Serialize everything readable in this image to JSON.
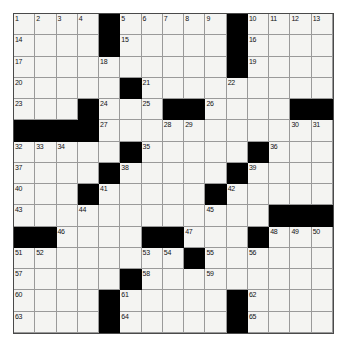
{
  "puzzle": {
    "title": "Crossword Puzzle Grid",
    "rows": 15,
    "cols": 15,
    "colors": {
      "block": "#000000",
      "cell": "#f4f4f2",
      "grid_line": "#8a8a8a",
      "border": "#4a4a4a",
      "number_text": "#121212",
      "background": "#ffffff"
    },
    "grid": [
      [
        {
          "type": "white",
          "number": "1"
        },
        {
          "type": "white",
          "number": "2"
        },
        {
          "type": "white",
          "number": "3"
        },
        {
          "type": "white",
          "number": "4"
        },
        {
          "type": "block",
          "number": ""
        },
        {
          "type": "white",
          "number": "5"
        },
        {
          "type": "white",
          "number": "6"
        },
        {
          "type": "white",
          "number": "7"
        },
        {
          "type": "white",
          "number": "8"
        },
        {
          "type": "white",
          "number": "9"
        },
        {
          "type": "block",
          "number": ""
        },
        {
          "type": "white",
          "number": "10"
        },
        {
          "type": "white",
          "number": "11"
        },
        {
          "type": "white",
          "number": "12"
        },
        {
          "type": "white",
          "number": "13"
        }
      ],
      [
        {
          "type": "white",
          "number": "14"
        },
        {
          "type": "white",
          "number": ""
        },
        {
          "type": "white",
          "number": ""
        },
        {
          "type": "white",
          "number": ""
        },
        {
          "type": "block",
          "number": ""
        },
        {
          "type": "white",
          "number": "15"
        },
        {
          "type": "white",
          "number": ""
        },
        {
          "type": "white",
          "number": ""
        },
        {
          "type": "white",
          "number": ""
        },
        {
          "type": "white",
          "number": ""
        },
        {
          "type": "block",
          "number": ""
        },
        {
          "type": "white",
          "number": "16"
        },
        {
          "type": "white",
          "number": ""
        },
        {
          "type": "white",
          "number": ""
        },
        {
          "type": "white",
          "number": ""
        }
      ],
      [
        {
          "type": "white",
          "number": "17"
        },
        {
          "type": "white",
          "number": ""
        },
        {
          "type": "white",
          "number": ""
        },
        {
          "type": "white",
          "number": ""
        },
        {
          "type": "white",
          "number": "18"
        },
        {
          "type": "white",
          "number": ""
        },
        {
          "type": "white",
          "number": ""
        },
        {
          "type": "white",
          "number": ""
        },
        {
          "type": "white",
          "number": ""
        },
        {
          "type": "white",
          "number": ""
        },
        {
          "type": "block",
          "number": ""
        },
        {
          "type": "white",
          "number": "19"
        },
        {
          "type": "white",
          "number": ""
        },
        {
          "type": "white",
          "number": ""
        },
        {
          "type": "white",
          "number": ""
        }
      ],
      [
        {
          "type": "white",
          "number": "20"
        },
        {
          "type": "white",
          "number": ""
        },
        {
          "type": "white",
          "number": ""
        },
        {
          "type": "white",
          "number": ""
        },
        {
          "type": "white",
          "number": ""
        },
        {
          "type": "block",
          "number": ""
        },
        {
          "type": "white",
          "number": "21"
        },
        {
          "type": "white",
          "number": ""
        },
        {
          "type": "white",
          "number": ""
        },
        {
          "type": "white",
          "number": ""
        },
        {
          "type": "white",
          "number": "22"
        },
        {
          "type": "white",
          "number": ""
        },
        {
          "type": "white",
          "number": ""
        },
        {
          "type": "white",
          "number": ""
        },
        {
          "type": "white",
          "number": ""
        }
      ],
      [
        {
          "type": "white",
          "number": "23"
        },
        {
          "type": "white",
          "number": ""
        },
        {
          "type": "white",
          "number": ""
        },
        {
          "type": "block",
          "number": ""
        },
        {
          "type": "white",
          "number": "24"
        },
        {
          "type": "white",
          "number": ""
        },
        {
          "type": "white",
          "number": "25"
        },
        {
          "type": "block",
          "number": ""
        },
        {
          "type": "block",
          "number": ""
        },
        {
          "type": "white",
          "number": "26"
        },
        {
          "type": "white",
          "number": ""
        },
        {
          "type": "white",
          "number": ""
        },
        {
          "type": "white",
          "number": ""
        },
        {
          "type": "block",
          "number": ""
        },
        {
          "type": "block",
          "number": ""
        }
      ],
      [
        {
          "type": "block",
          "number": ""
        },
        {
          "type": "block",
          "number": ""
        },
        {
          "type": "block",
          "number": ""
        },
        {
          "type": "block",
          "number": ""
        },
        {
          "type": "white",
          "number": "27"
        },
        {
          "type": "white",
          "number": ""
        },
        {
          "type": "white",
          "number": ""
        },
        {
          "type": "white",
          "number": "28"
        },
        {
          "type": "white",
          "number": "29"
        },
        {
          "type": "white",
          "number": ""
        },
        {
          "type": "white",
          "number": ""
        },
        {
          "type": "white",
          "number": ""
        },
        {
          "type": "white",
          "number": ""
        },
        {
          "type": "white",
          "number": "30"
        },
        {
          "type": "white",
          "number": "31"
        }
      ],
      [
        {
          "type": "white",
          "number": "32"
        },
        {
          "type": "white",
          "number": "33"
        },
        {
          "type": "white",
          "number": "34"
        },
        {
          "type": "white",
          "number": ""
        },
        {
          "type": "white",
          "number": ""
        },
        {
          "type": "block",
          "number": ""
        },
        {
          "type": "white",
          "number": "35"
        },
        {
          "type": "white",
          "number": ""
        },
        {
          "type": "white",
          "number": ""
        },
        {
          "type": "white",
          "number": ""
        },
        {
          "type": "white",
          "number": ""
        },
        {
          "type": "block",
          "number": ""
        },
        {
          "type": "white",
          "number": "36"
        },
        {
          "type": "white",
          "number": ""
        },
        {
          "type": "white",
          "number": ""
        }
      ],
      [
        {
          "type": "white",
          "number": "37"
        },
        {
          "type": "white",
          "number": ""
        },
        {
          "type": "white",
          "number": ""
        },
        {
          "type": "white",
          "number": ""
        },
        {
          "type": "block",
          "number": ""
        },
        {
          "type": "white",
          "number": "38"
        },
        {
          "type": "white",
          "number": ""
        },
        {
          "type": "white",
          "number": ""
        },
        {
          "type": "white",
          "number": ""
        },
        {
          "type": "white",
          "number": ""
        },
        {
          "type": "block",
          "number": ""
        },
        {
          "type": "white",
          "number": "39"
        },
        {
          "type": "white",
          "number": ""
        },
        {
          "type": "white",
          "number": ""
        },
        {
          "type": "white",
          "number": ""
        }
      ],
      [
        {
          "type": "white",
          "number": "40"
        },
        {
          "type": "white",
          "number": ""
        },
        {
          "type": "white",
          "number": ""
        },
        {
          "type": "block",
          "number": ""
        },
        {
          "type": "white",
          "number": "41"
        },
        {
          "type": "white",
          "number": ""
        },
        {
          "type": "white",
          "number": ""
        },
        {
          "type": "white",
          "number": ""
        },
        {
          "type": "white",
          "number": ""
        },
        {
          "type": "block",
          "number": ""
        },
        {
          "type": "white",
          "number": "42"
        },
        {
          "type": "white",
          "number": ""
        },
        {
          "type": "white",
          "number": ""
        },
        {
          "type": "white",
          "number": ""
        },
        {
          "type": "white",
          "number": ""
        }
      ],
      [
        {
          "type": "white",
          "number": "43"
        },
        {
          "type": "white",
          "number": ""
        },
        {
          "type": "white",
          "number": ""
        },
        {
          "type": "white",
          "number": "44"
        },
        {
          "type": "white",
          "number": ""
        },
        {
          "type": "white",
          "number": ""
        },
        {
          "type": "white",
          "number": ""
        },
        {
          "type": "white",
          "number": ""
        },
        {
          "type": "white",
          "number": ""
        },
        {
          "type": "white",
          "number": "45"
        },
        {
          "type": "white",
          "number": ""
        },
        {
          "type": "white",
          "number": ""
        },
        {
          "type": "block",
          "number": ""
        },
        {
          "type": "block",
          "number": ""
        },
        {
          "type": "block",
          "number": ""
        }
      ],
      [
        {
          "type": "block",
          "number": ""
        },
        {
          "type": "block",
          "number": ""
        },
        {
          "type": "white",
          "number": "46"
        },
        {
          "type": "white",
          "number": ""
        },
        {
          "type": "white",
          "number": ""
        },
        {
          "type": "white",
          "number": ""
        },
        {
          "type": "block",
          "number": ""
        },
        {
          "type": "block",
          "number": ""
        },
        {
          "type": "white",
          "number": "47"
        },
        {
          "type": "white",
          "number": ""
        },
        {
          "type": "white",
          "number": ""
        },
        {
          "type": "block",
          "number": ""
        },
        {
          "type": "white",
          "number": "48"
        },
        {
          "type": "white",
          "number": "49"
        },
        {
          "type": "white",
          "number": "50"
        }
      ],
      [
        {
          "type": "white",
          "number": "51"
        },
        {
          "type": "white",
          "number": "52"
        },
        {
          "type": "white",
          "number": ""
        },
        {
          "type": "white",
          "number": ""
        },
        {
          "type": "white",
          "number": ""
        },
        {
          "type": "white",
          "number": ""
        },
        {
          "type": "white",
          "number": "53"
        },
        {
          "type": "white",
          "number": "54"
        },
        {
          "type": "block",
          "number": ""
        },
        {
          "type": "white",
          "number": "55"
        },
        {
          "type": "white",
          "number": ""
        },
        {
          "type": "white",
          "number": "56"
        },
        {
          "type": "white",
          "number": ""
        },
        {
          "type": "white",
          "number": ""
        },
        {
          "type": "white",
          "number": ""
        }
      ],
      [
        {
          "type": "white",
          "number": "57"
        },
        {
          "type": "white",
          "number": ""
        },
        {
          "type": "white",
          "number": ""
        },
        {
          "type": "white",
          "number": ""
        },
        {
          "type": "white",
          "number": ""
        },
        {
          "type": "block",
          "number": ""
        },
        {
          "type": "white",
          "number": "58"
        },
        {
          "type": "white",
          "number": ""
        },
        {
          "type": "white",
          "number": ""
        },
        {
          "type": "white",
          "number": "59"
        },
        {
          "type": "white",
          "number": ""
        },
        {
          "type": "white",
          "number": ""
        },
        {
          "type": "white",
          "number": ""
        },
        {
          "type": "white",
          "number": ""
        },
        {
          "type": "white",
          "number": ""
        }
      ],
      [
        {
          "type": "white",
          "number": "60"
        },
        {
          "type": "white",
          "number": ""
        },
        {
          "type": "white",
          "number": ""
        },
        {
          "type": "white",
          "number": ""
        },
        {
          "type": "block",
          "number": ""
        },
        {
          "type": "white",
          "number": "61"
        },
        {
          "type": "white",
          "number": ""
        },
        {
          "type": "white",
          "number": ""
        },
        {
          "type": "white",
          "number": ""
        },
        {
          "type": "white",
          "number": ""
        },
        {
          "type": "block",
          "number": ""
        },
        {
          "type": "white",
          "number": "62"
        },
        {
          "type": "white",
          "number": ""
        },
        {
          "type": "white",
          "number": ""
        },
        {
          "type": "white",
          "number": ""
        }
      ],
      [
        {
          "type": "white",
          "number": "63"
        },
        {
          "type": "white",
          "number": ""
        },
        {
          "type": "white",
          "number": ""
        },
        {
          "type": "white",
          "number": ""
        },
        {
          "type": "block",
          "number": ""
        },
        {
          "type": "white",
          "number": "64"
        },
        {
          "type": "white",
          "number": ""
        },
        {
          "type": "white",
          "number": ""
        },
        {
          "type": "white",
          "number": ""
        },
        {
          "type": "white",
          "number": ""
        },
        {
          "type": "block",
          "number": ""
        },
        {
          "type": "white",
          "number": "65"
        },
        {
          "type": "white",
          "number": ""
        },
        {
          "type": "white",
          "number": ""
        },
        {
          "type": "white",
          "number": ""
        }
      ]
    ]
  }
}
